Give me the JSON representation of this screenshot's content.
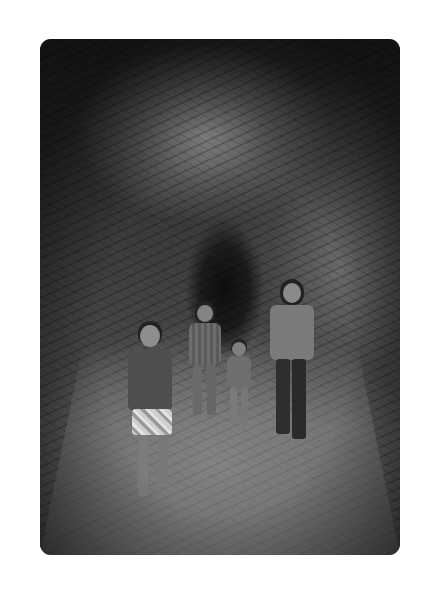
{
  "image": {
    "alt": "Black and white photo of a woman and three children walking through a rock tunnel",
    "style": "grayscale",
    "corner_radius_px": 11,
    "colors": {
      "page_background": "#ffffff",
      "rock_dark": "#1c1c1c",
      "rock_mid": "#474747",
      "floor_light": "#8d8d8d"
    }
  },
  "subjects": [
    {
      "id": "boy-front-left",
      "description": "boy in t-shirt and patterned shorts, pointing"
    },
    {
      "id": "girl-middle",
      "description": "girl in striped shirt"
    },
    {
      "id": "toddler",
      "description": "small child holding woman's hand"
    },
    {
      "id": "woman-right",
      "description": "woman with glasses in jacket and dark pants"
    }
  ]
}
